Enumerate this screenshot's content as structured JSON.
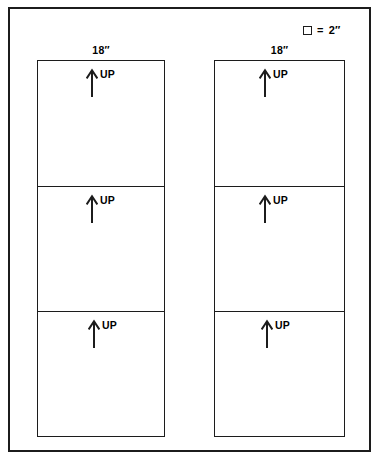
{
  "legend": {
    "swatch_icon": "square-outline-icon",
    "equals": "=",
    "value": "2″"
  },
  "columns": [
    {
      "id": "left",
      "width_label": "18″",
      "panels": [
        {
          "orientation_label": "UP",
          "arrow_icon": "arrow-up-icon"
        },
        {
          "orientation_label": "UP",
          "arrow_icon": "arrow-up-icon"
        },
        {
          "orientation_label": "UP",
          "arrow_icon": "arrow-up-icon"
        }
      ]
    },
    {
      "id": "right",
      "width_label": "18″",
      "panels": [
        {
          "orientation_label": "UP",
          "arrow_icon": "arrow-up-icon"
        },
        {
          "orientation_label": "UP",
          "arrow_icon": "arrow-up-icon"
        },
        {
          "orientation_label": "UP",
          "arrow_icon": "arrow-up-icon"
        }
      ]
    }
  ],
  "colors": {
    "line": "#1c1c1c",
    "background": "#ffffff"
  }
}
